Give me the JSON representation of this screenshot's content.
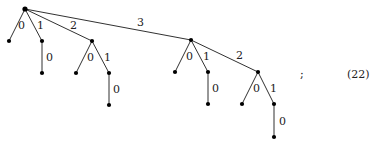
{
  "diagram": {
    "type": "rooted-tree",
    "nodes": [
      {
        "id": "r",
        "x": 25,
        "y": 9
      },
      {
        "id": "a",
        "x": 9,
        "y": 41
      },
      {
        "id": "b",
        "x": 42,
        "y": 41
      },
      {
        "id": "b0",
        "x": 42,
        "y": 73
      },
      {
        "id": "c",
        "x": 92,
        "y": 41
      },
      {
        "id": "c0",
        "x": 76,
        "y": 73
      },
      {
        "id": "c1",
        "x": 109,
        "y": 73
      },
      {
        "id": "c10",
        "x": 109,
        "y": 105
      },
      {
        "id": "d",
        "x": 191,
        "y": 40
      },
      {
        "id": "d0",
        "x": 175,
        "y": 72
      },
      {
        "id": "d1",
        "x": 208,
        "y": 72
      },
      {
        "id": "d10",
        "x": 208,
        "y": 104
      },
      {
        "id": "d2",
        "x": 258,
        "y": 72
      },
      {
        "id": "d20",
        "x": 242,
        "y": 104
      },
      {
        "id": "d21",
        "x": 274,
        "y": 104
      },
      {
        "id": "d210",
        "x": 274,
        "y": 137
      }
    ],
    "edges": [
      {
        "from": "r",
        "to": "a",
        "label": "0",
        "lx": 18,
        "ly": 29
      },
      {
        "from": "r",
        "to": "b",
        "label": "1",
        "lx": 37,
        "ly": 29
      },
      {
        "from": "b",
        "to": "b0",
        "label": "0",
        "lx": 46,
        "ly": 61
      },
      {
        "from": "r",
        "to": "c",
        "label": "2",
        "lx": 70,
        "ly": 29
      },
      {
        "from": "c",
        "to": "c0",
        "label": "0",
        "lx": 87,
        "ly": 61
      },
      {
        "from": "c",
        "to": "c1",
        "label": "1",
        "lx": 104,
        "ly": 61
      },
      {
        "from": "c1",
        "to": "c10",
        "label": "0",
        "lx": 113,
        "ly": 93
      },
      {
        "from": "r",
        "to": "d",
        "label": "3",
        "lx": 137,
        "ly": 26
      },
      {
        "from": "d",
        "to": "d0",
        "label": "0",
        "lx": 186,
        "ly": 60
      },
      {
        "from": "d",
        "to": "d1",
        "label": "1",
        "lx": 203,
        "ly": 60
      },
      {
        "from": "d1",
        "to": "d10",
        "label": "0",
        "lx": 212,
        "ly": 92
      },
      {
        "from": "d",
        "to": "d2",
        "label": "2",
        "lx": 236,
        "ly": 59
      },
      {
        "from": "d2",
        "to": "d20",
        "label": "0",
        "lx": 253,
        "ly": 92
      },
      {
        "from": "d2",
        "to": "d21",
        "label": "1",
        "lx": 270,
        "ly": 92
      },
      {
        "from": "d21",
        "to": "d210",
        "label": "0",
        "lx": 279,
        "ly": 125
      }
    ]
  },
  "punctuation": ";",
  "equation_number": "(22)"
}
